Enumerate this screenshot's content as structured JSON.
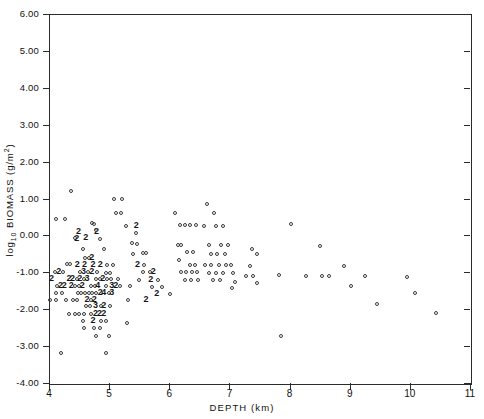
{
  "figure": {
    "background": "#ffffff",
    "ink_color": "#2b2b2b",
    "marker_color": "#3a3a3a"
  },
  "axes": {
    "x_title": "DEPTH (km)",
    "y_title_main": "log",
    "y_title_sub": "10",
    "y_title_rest": " BIOMASS (g/m",
    "y_title_sup": "2",
    "y_title_close": ")",
    "x_ticks": [
      "4",
      "5",
      "6",
      "7",
      "8",
      "9",
      "10",
      "11"
    ],
    "y_ticks": [
      "6.00",
      "5.00",
      "4.00",
      "3.00",
      "2.00",
      "1.00",
      "0.00",
      "-1.00",
      "-2.00",
      "-3.00",
      "-4.00"
    ]
  },
  "chart_data": {
    "type": "scatter",
    "title": "",
    "xlabel": "DEPTH (km)",
    "ylabel": "log10 BIOMASS (g/m^2)",
    "xlim": [
      4,
      11
    ],
    "ylim": [
      -4.0,
      6.0
    ],
    "xticks": [
      4,
      5,
      6,
      7,
      8,
      9,
      10,
      11
    ],
    "yticks": [
      -4,
      -3,
      -2,
      -1,
      0,
      1,
      2,
      3,
      4,
      5,
      6
    ],
    "grid": false,
    "legend": "none",
    "marker": "open-circle",
    "overplot_notation": "digit labels indicate number of coincident points",
    "points": [
      {
        "x": 4.36,
        "y": 1.2,
        "n": 1
      },
      {
        "x": 4.12,
        "y": 0.44,
        "n": 1
      },
      {
        "x": 4.26,
        "y": 0.44,
        "n": 1
      },
      {
        "x": 4.5,
        "y": 0.1,
        "n": 2
      },
      {
        "x": 4.44,
        "y": -0.08,
        "n": 1
      },
      {
        "x": 4.47,
        "y": -0.1,
        "n": 2
      },
      {
        "x": 4.62,
        "y": -0.08,
        "n": 2
      },
      {
        "x": 4.72,
        "y": 0.34,
        "n": 1
      },
      {
        "x": 4.75,
        "y": 0.3,
        "n": 1
      },
      {
        "x": 4.8,
        "y": 0.1,
        "n": 2
      },
      {
        "x": 4.78,
        "y": 0.14,
        "n": 1
      },
      {
        "x": 4.84,
        "y": -0.1,
        "n": 1
      },
      {
        "x": 4.92,
        "y": -0.36,
        "n": 1
      },
      {
        "x": 4.56,
        "y": -0.36,
        "n": 1
      },
      {
        "x": 4.6,
        "y": -0.62,
        "n": 1
      },
      {
        "x": 4.66,
        "y": -0.62,
        "n": 1
      },
      {
        "x": 4.72,
        "y": -0.62,
        "n": 2
      },
      {
        "x": 4.3,
        "y": -0.78,
        "n": 1
      },
      {
        "x": 4.35,
        "y": -0.78,
        "n": 1
      },
      {
        "x": 4.48,
        "y": -0.8,
        "n": 2
      },
      {
        "x": 4.6,
        "y": -0.8,
        "n": 2
      },
      {
        "x": 4.74,
        "y": -0.8,
        "n": 2
      },
      {
        "x": 4.86,
        "y": -0.8,
        "n": 2
      },
      {
        "x": 4.96,
        "y": -0.8,
        "n": 1
      },
      {
        "x": 5.06,
        "y": -0.8,
        "n": 1
      },
      {
        "x": 4.1,
        "y": -0.98,
        "n": 1
      },
      {
        "x": 4.17,
        "y": -0.98,
        "n": 2
      },
      {
        "x": 4.24,
        "y": -0.98,
        "n": 1
      },
      {
        "x": 4.52,
        "y": -1.0,
        "n": 1
      },
      {
        "x": 4.58,
        "y": -1.0,
        "n": 3
      },
      {
        "x": 4.65,
        "y": -1.0,
        "n": 1
      },
      {
        "x": 4.72,
        "y": -1.0,
        "n": 2
      },
      {
        "x": 4.8,
        "y": -1.0,
        "n": 1
      },
      {
        "x": 4.94,
        "y": -1.02,
        "n": 1
      },
      {
        "x": 5.02,
        "y": -1.02,
        "n": 1
      },
      {
        "x": 4.05,
        "y": -1.18,
        "n": 2
      },
      {
        "x": 4.34,
        "y": -1.18,
        "n": 2
      },
      {
        "x": 4.4,
        "y": -1.18,
        "n": 2
      },
      {
        "x": 4.46,
        "y": -1.18,
        "n": 1
      },
      {
        "x": 4.52,
        "y": -1.18,
        "n": 2
      },
      {
        "x": 4.58,
        "y": -1.18,
        "n": 1
      },
      {
        "x": 4.64,
        "y": -1.18,
        "n": 3
      },
      {
        "x": 4.78,
        "y": -1.18,
        "n": 1
      },
      {
        "x": 4.84,
        "y": -1.18,
        "n": 1
      },
      {
        "x": 4.9,
        "y": -1.18,
        "n": 2
      },
      {
        "x": 4.97,
        "y": -1.18,
        "n": 1
      },
      {
        "x": 5.03,
        "y": -1.18,
        "n": 1
      },
      {
        "x": 5.14,
        "y": -1.18,
        "n": 1
      },
      {
        "x": 4.14,
        "y": -1.36,
        "n": 1
      },
      {
        "x": 4.2,
        "y": -1.36,
        "n": 2
      },
      {
        "x": 4.26,
        "y": -1.36,
        "n": 2
      },
      {
        "x": 4.38,
        "y": -1.36,
        "n": 2
      },
      {
        "x": 4.44,
        "y": -1.36,
        "n": 1
      },
      {
        "x": 4.5,
        "y": -1.36,
        "n": 1
      },
      {
        "x": 4.56,
        "y": -1.36,
        "n": 2
      },
      {
        "x": 4.7,
        "y": -1.36,
        "n": 1
      },
      {
        "x": 4.76,
        "y": -1.36,
        "n": 1
      },
      {
        "x": 4.82,
        "y": -1.36,
        "n": 4
      },
      {
        "x": 4.94,
        "y": -1.36,
        "n": 1
      },
      {
        "x": 5.05,
        "y": -1.36,
        "n": 3
      },
      {
        "x": 5.12,
        "y": -1.36,
        "n": 2
      },
      {
        "x": 5.18,
        "y": -1.36,
        "n": 1
      },
      {
        "x": 5.34,
        "y": -1.36,
        "n": 1
      },
      {
        "x": 4.12,
        "y": -1.55,
        "n": 1
      },
      {
        "x": 4.22,
        "y": -1.55,
        "n": 1
      },
      {
        "x": 4.48,
        "y": -1.55,
        "n": 1
      },
      {
        "x": 4.54,
        "y": -1.55,
        "n": 1
      },
      {
        "x": 4.6,
        "y": -1.55,
        "n": 1
      },
      {
        "x": 4.66,
        "y": -1.55,
        "n": 1
      },
      {
        "x": 4.72,
        "y": -1.55,
        "n": 1
      },
      {
        "x": 4.78,
        "y": -1.55,
        "n": 1
      },
      {
        "x": 4.86,
        "y": -1.55,
        "n": 2
      },
      {
        "x": 4.92,
        "y": -1.55,
        "n": 4
      },
      {
        "x": 4.99,
        "y": -1.55,
        "n": 1
      },
      {
        "x": 5.05,
        "y": -1.55,
        "n": 3
      },
      {
        "x": 4.02,
        "y": -1.74,
        "n": 1
      },
      {
        "x": 4.12,
        "y": -1.74,
        "n": 1
      },
      {
        "x": 4.28,
        "y": -1.74,
        "n": 1
      },
      {
        "x": 4.4,
        "y": -1.74,
        "n": 1
      },
      {
        "x": 4.46,
        "y": -1.74,
        "n": 1
      },
      {
        "x": 4.64,
        "y": -1.74,
        "n": 2
      },
      {
        "x": 4.7,
        "y": -1.74,
        "n": 1
      },
      {
        "x": 4.76,
        "y": -1.74,
        "n": 2
      },
      {
        "x": 5.32,
        "y": -1.74,
        "n": 1
      },
      {
        "x": 5.62,
        "y": -1.74,
        "n": 2
      },
      {
        "x": 4.62,
        "y": -1.92,
        "n": 1
      },
      {
        "x": 4.68,
        "y": -1.92,
        "n": 1
      },
      {
        "x": 4.78,
        "y": -1.92,
        "n": 3
      },
      {
        "x": 4.86,
        "y": -1.92,
        "n": 1
      },
      {
        "x": 4.92,
        "y": -1.92,
        "n": 2
      },
      {
        "x": 5.02,
        "y": -1.92,
        "n": 1
      },
      {
        "x": 4.34,
        "y": -2.12,
        "n": 1
      },
      {
        "x": 4.44,
        "y": -2.12,
        "n": 1
      },
      {
        "x": 4.5,
        "y": -2.12,
        "n": 1
      },
      {
        "x": 4.58,
        "y": -2.12,
        "n": 1
      },
      {
        "x": 4.7,
        "y": -2.12,
        "n": 1
      },
      {
        "x": 4.78,
        "y": -2.12,
        "n": 2
      },
      {
        "x": 4.85,
        "y": -2.12,
        "n": 2
      },
      {
        "x": 4.92,
        "y": -2.12,
        "n": 2
      },
      {
        "x": 4.56,
        "y": -2.32,
        "n": 1
      },
      {
        "x": 4.74,
        "y": -2.32,
        "n": 2
      },
      {
        "x": 4.86,
        "y": -2.32,
        "n": 1
      },
      {
        "x": 4.94,
        "y": -2.32,
        "n": 1
      },
      {
        "x": 4.58,
        "y": -2.5,
        "n": 1
      },
      {
        "x": 4.74,
        "y": -2.5,
        "n": 1
      },
      {
        "x": 4.84,
        "y": -2.5,
        "n": 1
      },
      {
        "x": 4.78,
        "y": -2.72,
        "n": 1
      },
      {
        "x": 5.0,
        "y": -2.72,
        "n": 1
      },
      {
        "x": 5.3,
        "y": -2.38,
        "n": 1
      },
      {
        "x": 4.2,
        "y": -3.2,
        "n": 1
      },
      {
        "x": 4.94,
        "y": -3.2,
        "n": 1
      },
      {
        "x": 5.08,
        "y": 1.0,
        "n": 1
      },
      {
        "x": 5.22,
        "y": 1.0,
        "n": 1
      },
      {
        "x": 5.12,
        "y": 0.62,
        "n": 1
      },
      {
        "x": 5.2,
        "y": 0.62,
        "n": 1
      },
      {
        "x": 5.28,
        "y": 0.26,
        "n": 1
      },
      {
        "x": 5.46,
        "y": 0.26,
        "n": 2
      },
      {
        "x": 5.44,
        "y": 0.06,
        "n": 1
      },
      {
        "x": 5.38,
        "y": -0.2,
        "n": 1
      },
      {
        "x": 5.46,
        "y": -0.24,
        "n": 1
      },
      {
        "x": 5.4,
        "y": -0.5,
        "n": 1
      },
      {
        "x": 5.56,
        "y": -0.48,
        "n": 1
      },
      {
        "x": 5.62,
        "y": -0.48,
        "n": 1
      },
      {
        "x": 5.48,
        "y": -0.8,
        "n": 2
      },
      {
        "x": 5.58,
        "y": -0.8,
        "n": 1
      },
      {
        "x": 5.68,
        "y": -0.98,
        "n": 1
      },
      {
        "x": 5.74,
        "y": -0.98,
        "n": 2
      },
      {
        "x": 5.56,
        "y": -1.0,
        "n": 1
      },
      {
        "x": 5.5,
        "y": -1.22,
        "n": 1
      },
      {
        "x": 5.7,
        "y": -1.22,
        "n": 2
      },
      {
        "x": 5.82,
        "y": -1.22,
        "n": 1
      },
      {
        "x": 5.72,
        "y": -1.4,
        "n": 1
      },
      {
        "x": 5.88,
        "y": -1.4,
        "n": 1
      },
      {
        "x": 5.8,
        "y": -1.58,
        "n": 2
      },
      {
        "x": 6.02,
        "y": -1.58,
        "n": 1
      },
      {
        "x": 6.1,
        "y": 0.62,
        "n": 1
      },
      {
        "x": 6.18,
        "y": 0.28,
        "n": 1
      },
      {
        "x": 6.26,
        "y": 0.28,
        "n": 1
      },
      {
        "x": 6.34,
        "y": 0.28,
        "n": 1
      },
      {
        "x": 6.44,
        "y": 0.28,
        "n": 1
      },
      {
        "x": 6.14,
        "y": -0.26,
        "n": 1
      },
      {
        "x": 6.2,
        "y": -0.26,
        "n": 1
      },
      {
        "x": 6.3,
        "y": -0.46,
        "n": 1
      },
      {
        "x": 6.4,
        "y": -0.46,
        "n": 1
      },
      {
        "x": 6.16,
        "y": -0.66,
        "n": 1
      },
      {
        "x": 6.34,
        "y": -0.8,
        "n": 1
      },
      {
        "x": 6.42,
        "y": -0.8,
        "n": 1
      },
      {
        "x": 6.2,
        "y": -1.0,
        "n": 1
      },
      {
        "x": 6.28,
        "y": -1.0,
        "n": 1
      },
      {
        "x": 6.38,
        "y": -1.0,
        "n": 1
      },
      {
        "x": 6.46,
        "y": -1.0,
        "n": 1
      },
      {
        "x": 6.26,
        "y": -1.2,
        "n": 1
      },
      {
        "x": 6.36,
        "y": -1.2,
        "n": 1
      },
      {
        "x": 6.48,
        "y": -1.2,
        "n": 1
      },
      {
        "x": 6.62,
        "y": 0.86,
        "n": 1
      },
      {
        "x": 6.74,
        "y": 0.6,
        "n": 1
      },
      {
        "x": 6.58,
        "y": 0.26,
        "n": 1
      },
      {
        "x": 6.78,
        "y": 0.26,
        "n": 1
      },
      {
        "x": 6.9,
        "y": 0.26,
        "n": 1
      },
      {
        "x": 6.66,
        "y": -0.26,
        "n": 1
      },
      {
        "x": 6.86,
        "y": -0.26,
        "n": 1
      },
      {
        "x": 6.98,
        "y": -0.26,
        "n": 1
      },
      {
        "x": 6.7,
        "y": -0.5,
        "n": 1
      },
      {
        "x": 6.8,
        "y": -0.5,
        "n": 1
      },
      {
        "x": 6.92,
        "y": -0.5,
        "n": 1
      },
      {
        "x": 6.6,
        "y": -0.8,
        "n": 1
      },
      {
        "x": 6.7,
        "y": -0.8,
        "n": 1
      },
      {
        "x": 6.82,
        "y": -0.8,
        "n": 1
      },
      {
        "x": 6.94,
        "y": -0.8,
        "n": 1
      },
      {
        "x": 7.02,
        "y": -0.8,
        "n": 1
      },
      {
        "x": 6.66,
        "y": -1.02,
        "n": 1
      },
      {
        "x": 6.78,
        "y": -1.02,
        "n": 1
      },
      {
        "x": 6.9,
        "y": -1.02,
        "n": 1
      },
      {
        "x": 7.06,
        "y": -1.02,
        "n": 1
      },
      {
        "x": 6.72,
        "y": -1.2,
        "n": 1
      },
      {
        "x": 6.84,
        "y": -1.2,
        "n": 1
      },
      {
        "x": 7.1,
        "y": -1.25,
        "n": 1
      },
      {
        "x": 7.04,
        "y": -1.42,
        "n": 1
      },
      {
        "x": 7.38,
        "y": -0.36,
        "n": 1
      },
      {
        "x": 7.46,
        "y": -0.5,
        "n": 1
      },
      {
        "x": 7.34,
        "y": -0.82,
        "n": 1
      },
      {
        "x": 7.28,
        "y": -1.1,
        "n": 1
      },
      {
        "x": 7.4,
        "y": -1.1,
        "n": 1
      },
      {
        "x": 7.46,
        "y": -1.28,
        "n": 1
      },
      {
        "x": 7.82,
        "y": -1.08,
        "n": 1
      },
      {
        "x": 7.86,
        "y": -2.72,
        "n": 1
      },
      {
        "x": 8.02,
        "y": 0.3,
        "n": 1
      },
      {
        "x": 8.28,
        "y": -1.1,
        "n": 1
      },
      {
        "x": 8.54,
        "y": -1.1,
        "n": 1
      },
      {
        "x": 8.66,
        "y": -1.1,
        "n": 1
      },
      {
        "x": 8.5,
        "y": -0.3,
        "n": 1
      },
      {
        "x": 8.9,
        "y": -0.82,
        "n": 1
      },
      {
        "x": 9.26,
        "y": -1.1,
        "n": 1
      },
      {
        "x": 9.02,
        "y": -1.38,
        "n": 1
      },
      {
        "x": 9.46,
        "y": -1.86,
        "n": 1
      },
      {
        "x": 9.96,
        "y": -1.14,
        "n": 1
      },
      {
        "x": 10.08,
        "y": -1.56,
        "n": 1
      },
      {
        "x": 10.44,
        "y": -2.1,
        "n": 1
      }
    ]
  }
}
